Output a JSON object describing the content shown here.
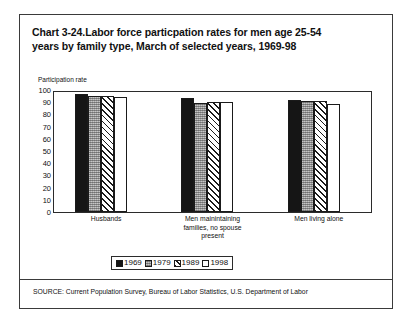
{
  "figure": {
    "title_prefix": "Chart 3-24.",
    "title": "Chart 3-24.Labor force particpation rates for men age 25-54 years by family type, March of selected years, 1969-98",
    "title_line1": "Chart 3-24.Labor force particpation rates for men age 25-54",
    "title_line2": "years by family type, March of selected years, 1969-98",
    "axis_title": "Participation rate",
    "source": "SOURCE: Current Population Survey, Bureau of Labor Statistics, U.S. Department of Labor",
    "colors": {
      "frame": "#3a3a3a",
      "axis": "#2b2b2b",
      "text": "#111111",
      "series_1969": "#151515",
      "series_1979": "#a8a8a8",
      "series_1989": "#ffffff",
      "series_1998": "#ffffff"
    }
  },
  "chart_data": {
    "type": "bar",
    "title": "Chart 3-24.Labor force particpation rates for men age 25-54 years by family type, March of selected years, 1969-98",
    "xlabel": "",
    "ylabel": "Participation rate",
    "ylim": [
      0,
      100
    ],
    "yticks": [
      0,
      10,
      20,
      30,
      40,
      50,
      60,
      70,
      80,
      90,
      100
    ],
    "ytick_labels": [
      "0",
      "10",
      "20",
      "30",
      "40",
      "50",
      "60",
      "70",
      "80",
      "90",
      "100"
    ],
    "grid": false,
    "legend_position": "bottom-center",
    "categories": [
      "Husbands",
      "Men mainintaining families, no spouse present",
      "Men living alone"
    ],
    "category_label_lines": [
      [
        "Husbands"
      ],
      [
        "Men mainintaining",
        "families, no spouse",
        "present"
      ],
      [
        "Men living alone"
      ]
    ],
    "series": [
      {
        "name": "1969",
        "pattern": "solid",
        "values": [
          98.0,
          95.0,
          93.0
        ]
      },
      {
        "name": "1979",
        "pattern": "stipple",
        "values": [
          97.0,
          91.0,
          92.5
        ]
      },
      {
        "name": "1989",
        "pattern": "hatch",
        "values": [
          96.5,
          92.0,
          92.5
        ]
      },
      {
        "name": "1998",
        "pattern": "empty",
        "values": [
          96.0,
          91.5,
          90.0
        ]
      }
    ],
    "legend": [
      "1969",
      "1979",
      "1989",
      "1998"
    ]
  }
}
